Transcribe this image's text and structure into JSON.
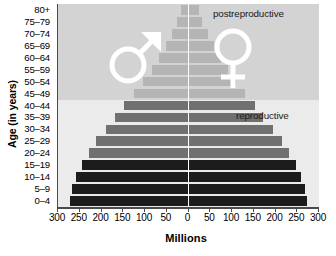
{
  "chart_data": {
    "type": "bar",
    "subtype": "population-pyramid",
    "title": "",
    "xlabel": "Millions",
    "ylabel": "Age (in years)",
    "categories": [
      "80+",
      "75–79",
      "70–74",
      "65–69",
      "60–64",
      "55–59",
      "50–54",
      "45–49",
      "40–44",
      "35–39",
      "30–34",
      "25–29",
      "20–24",
      "15–19",
      "10–14",
      "5–9",
      "0–4"
    ],
    "xticks": [
      "300",
      "250",
      "200",
      "150",
      "100",
      "50",
      "0",
      "50",
      "100",
      "150",
      "200",
      "250",
      "300"
    ],
    "xtick_values": [
      -300,
      -250,
      -200,
      -150,
      -100,
      -50,
      0,
      50,
      100,
      150,
      200,
      250,
      300
    ],
    "xlim": [
      -300,
      300
    ],
    "grid": false,
    "legend": "none",
    "series": [
      {
        "name": "Male",
        "side": "left",
        "values": [
          18,
          26,
          38,
          52,
          68,
          84,
          104,
          125,
          148,
          168,
          190,
          212,
          228,
          245,
          258,
          268,
          272
        ]
      },
      {
        "name": "Female",
        "side": "right",
        "values": [
          24,
          32,
          44,
          58,
          74,
          90,
          110,
          130,
          152,
          172,
          194,
          214,
          230,
          246,
          258,
          268,
          272
        ]
      }
    ],
    "group_colors": {
      "postreproductive": "#b5b5b5",
      "reproductive": "#707070",
      "prereproductive": "#1c1c1c"
    },
    "groups": [
      {
        "name": "postreproductive",
        "categories": [
          "80+",
          "75–79",
          "70–74",
          "65–69",
          "60–64",
          "55–59",
          "50–54",
          "45–49"
        ]
      },
      {
        "name": "reproductive",
        "categories": [
          "40–44",
          "35–39",
          "30–34",
          "25–29",
          "20–24"
        ]
      },
      {
        "name": "prereproductive",
        "categories": [
          "15–19",
          "10–14",
          "5–9",
          "0–4"
        ]
      }
    ],
    "annotations": [
      {
        "text": "postreproductive",
        "name": "postreproductive-label"
      },
      {
        "text": "reproductive",
        "name": "reproductive-label"
      }
    ],
    "symbols": [
      {
        "name": "male-symbol",
        "glyph": "mars",
        "side": "left"
      },
      {
        "name": "female-symbol",
        "glyph": "venus",
        "side": "right"
      }
    ],
    "panel_background_upper": "#d3d3d3",
    "panel_background_lower": "#ebebeb",
    "axis_color": "#4a4a4a"
  }
}
